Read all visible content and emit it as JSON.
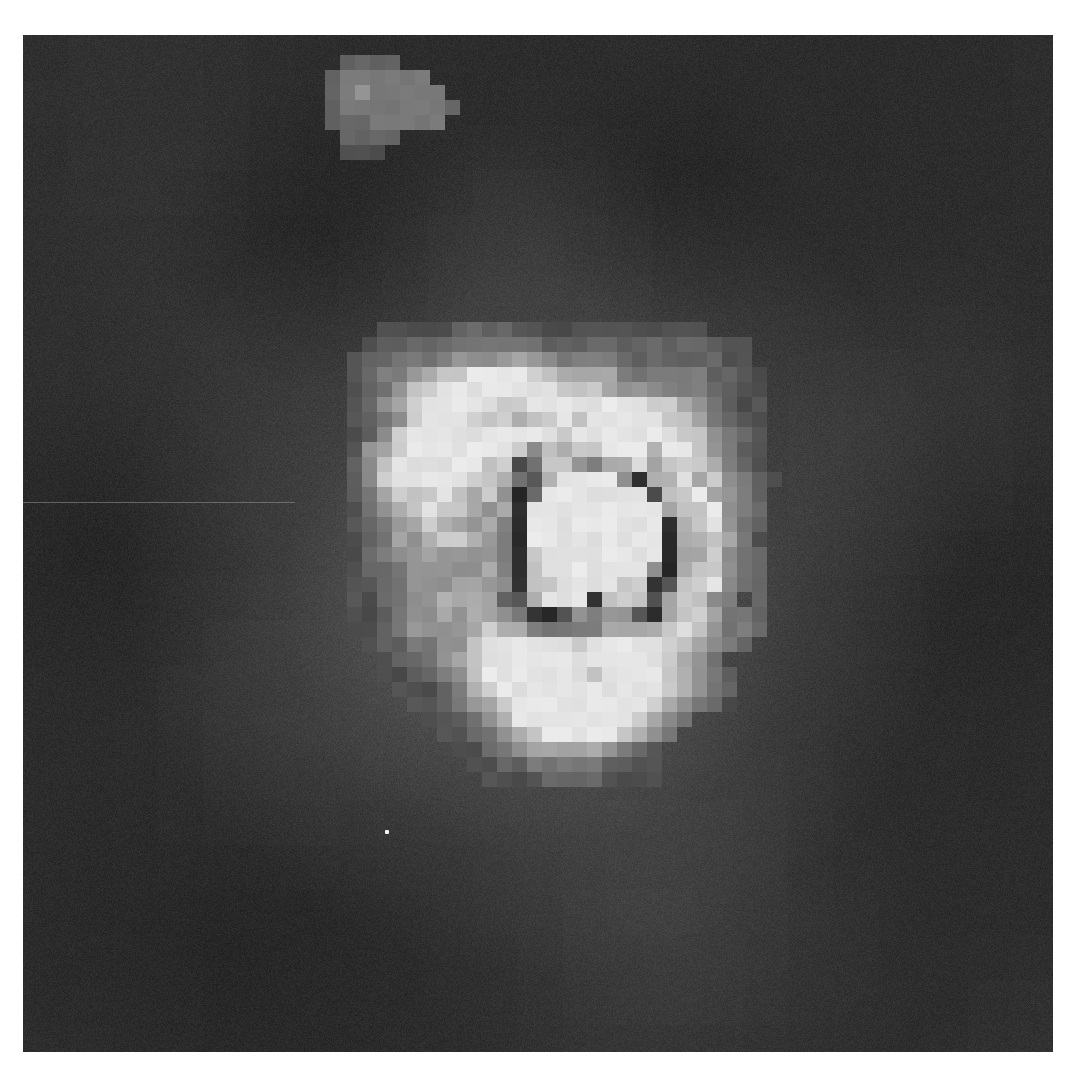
{
  "image": {
    "description": "Low-resolution grayscale fluorescence-style micrograph of a single cell, nearest-neighbor upscaled, with a dark ring-shaped nucleus inside a bright cytoplasm region and a faint secondary blob near the top",
    "colors": {
      "background_dark": "#2b2b2b",
      "background_mid": "#3c3c3c",
      "glow": "#6a6a6a",
      "bright": "#e8e8e8",
      "ring_dark": "#1e1e1e",
      "page_margin": "#ffffff"
    },
    "features": [
      "faint gray blob near top-left-center",
      "bright irregular cell body at center",
      "dark ring outline (nucleus) inside the cell body",
      "bright tail region below the nucleus",
      "single-pixel white speck lower-left of cell",
      "faint horizontal scanline artifact on left side"
    ],
    "cell_intensity_grid": [
      "..................................",
      "....3333344443333333333333........",
      "...34444455555544444444444433.....",
      "..344555566667665555444444433.....",
      "..3455678899998877775555554433....",
      "..3456889999999988876665554433....",
      "..3467899999889999999988765433....",
      "..3456899988878898999998875433....",
      "..3468999999999989999999886543....",
      "..3678999999986878899979986543....",
      "..4689999998835886577978887543....",
      "..46899999887537999962779786543...",
      "..4578889878624999999938897654....",
      "..3567898876729999999997889654....",
      "..3456787767529999999992789654....",
      "..3457678876529999999992778753....",
      "..3456676666528999999992778654....",
      "..3445666667528999999962788654....",
      "..3345666776628899998823889654....",
      "..33456677774379992888378865.4....",
      "..3345667677652236566327887554....",
      "..3345666678775555577778986554....",
      "...34455668999999899999887654.....",
      "....34456789999999999998765.......",
      "....334456899999998999987654......",
      ".....33345789999999999987654......",
      "......3345678999999999876543......",
      ".......334567999999998765.........",
      "........3345678999998765..........",
      ".........33456777776543...........",
      "..........3344555554433...........",
      "...........333344443333...........",
      ".................................."
    ],
    "top_blob_intensity_grid": [
      "..4444.....",
      ".4555555...",
      ".45655555..",
      ".455555554.",
      ".44455555..",
      "..4444.....",
      "..333......"
    ]
  }
}
